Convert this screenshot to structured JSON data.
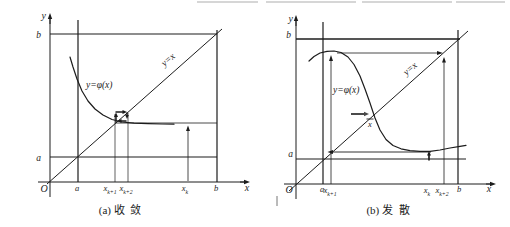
{
  "figure": {
    "background": "#ffffff",
    "ink": "#1c1c1c",
    "artifacts": {
      "top_crop_marks": [
        {
          "name": "cropped-text-remnant",
          "x1": 197,
          "x2": 258,
          "y": 2
        },
        {
          "name": "cropped-text-remnant",
          "x1": 266,
          "x2": 356,
          "y": 2
        },
        {
          "name": "cropped-text-remnant",
          "x1": 362,
          "x2": 452,
          "y": 2
        },
        {
          "name": "cropped-text-remnant",
          "x1": 456,
          "x2": 505,
          "y": 2
        }
      ],
      "stray_mark": {
        "name": "stray-vertical-mark",
        "x1": 277,
        "y1": 196,
        "x2": 277,
        "y2": 206,
        "w": 0.9,
        "color": "#666666"
      }
    },
    "panels": [
      {
        "id": "a",
        "caption": "(a) 收  敛",
        "lines": [
          {
            "name": "y-axis",
            "x1": 50,
            "y1": 197,
            "x2": 50,
            "y2": 16,
            "w": 1
          },
          {
            "name": "x-axis",
            "x1": 38,
            "y1": 182,
            "x2": 246,
            "y2": 182,
            "w": 1
          },
          {
            "name": "line-y-equals-b",
            "x1": 50,
            "y1": 34,
            "x2": 217,
            "y2": 34,
            "w": 1.2
          },
          {
            "name": "line-y-equals-a",
            "x1": 50,
            "y1": 157,
            "x2": 217,
            "y2": 157,
            "w": 1.2
          },
          {
            "name": "line-x-equals-a",
            "x1": 78,
            "y1": 20,
            "x2": 78,
            "y2": 182,
            "w": 1.2
          },
          {
            "name": "line-x-equals-b",
            "x1": 217,
            "y1": 30,
            "x2": 217,
            "y2": 182,
            "w": 1.2
          },
          {
            "name": "diagonal-y-equals-x",
            "x1": 47,
            "y1": 184,
            "x2": 222,
            "y2": 29,
            "w": 1
          },
          {
            "name": "iteration-level-line",
            "x1": 115,
            "y1": 123,
            "x2": 217,
            "y2": 123,
            "w": 0.8
          },
          {
            "name": "guide-line-x-k1",
            "x1": 115,
            "y1": 182,
            "x2": 115,
            "y2": 114,
            "w": 0.7
          },
          {
            "name": "guide-line-x-k2",
            "x1": 128,
            "y1": 182,
            "x2": 128,
            "y2": 113,
            "w": 0.7
          }
        ],
        "arrows": [
          {
            "name": "y-axis-arrowhead",
            "x1": 50,
            "y1": 24,
            "x2": 50,
            "y2": 13,
            "w": 1,
            "head": 6,
            "hw": 2.2
          },
          {
            "name": "x-axis-arrowhead",
            "x1": 240,
            "y1": 182,
            "x2": 250,
            "y2": 182,
            "w": 1,
            "head": 6,
            "hw": 2.2
          },
          {
            "name": "arrow-up-at-xk",
            "x1": 188,
            "y1": 181,
            "x2": 188,
            "y2": 125.5,
            "w": 0.8,
            "head": 5.5,
            "hw": 2
          },
          {
            "name": "cobweb-arrow-up",
            "x1": 116,
            "y1": 122.5,
            "x2": 116,
            "y2": 112.5,
            "w": 1.5,
            "head": 4.5,
            "hw": 2
          },
          {
            "name": "cobweb-arrow-right",
            "x1": 115.5,
            "y1": 112,
            "x2": 127,
            "y2": 112,
            "w": 1.5,
            "head": 4.5,
            "hw": 2
          },
          {
            "name": "cobweb-arrow-down",
            "x1": 127,
            "y1": 112.5,
            "x2": 127,
            "y2": 119,
            "w": 1.5,
            "head": 4,
            "hw": 1.8
          },
          {
            "name": "cobweb-arrow-left",
            "x1": 126.5,
            "y1": 121,
            "x2": 117,
            "y2": 121,
            "w": 1.5,
            "head": 4.5,
            "hw": 2
          }
        ],
        "curve": {
          "name": "curve-phi-of-x",
          "w": 1.2,
          "points": [
            [
              70,
              57
            ],
            [
              73,
              67
            ],
            [
              77,
              79
            ],
            [
              82,
              91
            ],
            [
              88,
              101
            ],
            [
              95,
              109
            ],
            [
              103,
              115
            ],
            [
              112,
              119.5
            ],
            [
              122,
              122
            ],
            [
              134,
              123.2
            ],
            [
              148,
              123.7
            ],
            [
              162,
              124
            ],
            [
              174,
              124.2
            ]
          ]
        },
        "texts": [
          {
            "name": "y-axis-label",
            "t": "y",
            "x": 46,
            "y": 19,
            "anchor": "end",
            "size": 10,
            "it": true
          },
          {
            "name": "x-axis-label",
            "t": "x",
            "x": 247,
            "y": 191,
            "anchor": "middle",
            "size": 10,
            "it": true
          },
          {
            "name": "origin-label",
            "t": "O",
            "x": 44,
            "y": 192,
            "anchor": "middle",
            "size": 10,
            "it": true
          },
          {
            "name": "b-value-label",
            "t": "b",
            "x": 41,
            "y": 38,
            "anchor": "end",
            "size": 9.5,
            "it": true
          },
          {
            "name": "a-value-label",
            "t": "a",
            "x": 41,
            "y": 161,
            "anchor": "end",
            "size": 9.5,
            "it": true
          },
          {
            "name": "curve-equation-label",
            "t": "y=φ(x)",
            "x": 86,
            "y": 88,
            "anchor": "start",
            "size": 9.5,
            "it": true
          },
          {
            "name": "diagonal-equation-label",
            "t": "y=x",
            "x": 170,
            "y": 62,
            "anchor": "middle",
            "size": 9.5,
            "it": true,
            "rotate": -41
          },
          {
            "name": "tick-a",
            "t": "a",
            "x": 77,
            "y": 191,
            "anchor": "middle",
            "size": 8.5,
            "it": true
          },
          {
            "name": "tick-x-k1",
            "t": "x",
            "sub": "k+1",
            "x": 110,
            "y": 191,
            "anchor": "middle",
            "size": 8.5,
            "it": true
          },
          {
            "name": "tick-x-k2",
            "t": "x",
            "sub": "k+2",
            "x": 126,
            "y": 191,
            "anchor": "middle",
            "size": 8.5,
            "it": true
          },
          {
            "name": "tick-x-k",
            "t": "x",
            "sub": "k",
            "x": 185,
            "y": 191,
            "anchor": "middle",
            "size": 8.5,
            "it": true
          },
          {
            "name": "tick-b",
            "t": "b",
            "x": 216,
            "y": 191,
            "anchor": "middle",
            "size": 8.5,
            "it": true
          }
        ]
      },
      {
        "id": "b",
        "caption": "(b) 发  散",
        "lines": [
          {
            "name": "y-axis",
            "x1": 296,
            "y1": 199,
            "x2": 296,
            "y2": 18,
            "w": 1
          },
          {
            "name": "x-axis",
            "x1": 284,
            "y1": 184,
            "x2": 492,
            "y2": 184,
            "w": 1
          },
          {
            "name": "line-y-equals-b",
            "x1": 296,
            "y1": 39,
            "x2": 460,
            "y2": 39,
            "w": 1.3
          },
          {
            "name": "line-y-equals-a",
            "x1": 296,
            "y1": 159,
            "x2": 466,
            "y2": 159,
            "w": 1.2
          },
          {
            "name": "line-x-equals-a",
            "x1": 323,
            "y1": 22,
            "x2": 323,
            "y2": 184,
            "w": 1.2
          },
          {
            "name": "line-x-equals-b",
            "x1": 458,
            "y1": 30,
            "x2": 458,
            "y2": 184,
            "w": 1.2
          },
          {
            "name": "diagonal-y-equals-x",
            "x1": 289,
            "y1": 191,
            "x2": 468,
            "y2": 31,
            "w": 1
          },
          {
            "name": "fixed-point-overbar",
            "x1": 366.5,
            "y1": 119,
            "x2": 373.5,
            "y2": 119,
            "w": 0.9
          }
        ],
        "arrows": [
          {
            "name": "y-axis-arrowhead",
            "x1": 296,
            "y1": 26,
            "x2": 296,
            "y2": 15,
            "w": 1,
            "head": 6,
            "hw": 2.2
          },
          {
            "name": "x-axis-arrowhead",
            "x1": 486,
            "y1": 184,
            "x2": 496,
            "y2": 184,
            "w": 1,
            "head": 6,
            "hw": 2.2
          },
          {
            "name": "arrow-up-at-xk1",
            "x1": 331,
            "y1": 184,
            "x2": 331,
            "y2": 55,
            "w": 0.8,
            "head": 6,
            "hw": 2
          },
          {
            "name": "arrow-right-top-level",
            "x1": 337,
            "y1": 53,
            "x2": 443,
            "y2": 53,
            "w": 0.8,
            "head": 6,
            "hw": 2
          },
          {
            "name": "arrow-up-at-xk2",
            "x1": 444,
            "y1": 184,
            "x2": 444,
            "y2": 57,
            "w": 0.8,
            "head": 5.5,
            "hw": 2
          },
          {
            "name": "arrow-left-low-level",
            "x1": 431,
            "y1": 152,
            "x2": 327.5,
            "y2": 152,
            "w": 0.9,
            "head": 5.5,
            "hw": 2
          },
          {
            "name": "arrow-up-at-xk-short",
            "x1": 429,
            "y1": 160.5,
            "x2": 429,
            "y2": 151,
            "w": 1.7,
            "head": 4.5,
            "hw": 2
          },
          {
            "name": "arrow-right-at-fixed-point",
            "x1": 351,
            "y1": 114,
            "x2": 369,
            "y2": 114,
            "w": 2,
            "head": 5,
            "hw": 2.2,
            "color": "#4a4a4a"
          }
        ],
        "curve": {
          "name": "curve-phi-of-x",
          "w": 1.2,
          "points": [
            [
              309,
              61
            ],
            [
              314,
              56.5
            ],
            [
              320,
              53
            ],
            [
              327,
              51.3
            ],
            [
              334,
              51
            ],
            [
              341,
              52.5
            ],
            [
              348,
              57
            ],
            [
              354,
              64.5
            ],
            [
              360,
              76
            ],
            [
              365,
              89
            ],
            [
              370,
              103
            ],
            [
              375,
              118
            ],
            [
              380,
              130
            ],
            [
              386,
              139.5
            ],
            [
              393,
              145.5
            ],
            [
              401,
              148.8
            ],
            [
              410,
              150.6
            ],
            [
              420,
              151.4
            ],
            [
              430,
              151.3
            ],
            [
              440,
              150
            ],
            [
              450,
              148
            ],
            [
              460,
              146.3
            ],
            [
              466,
              145.3
            ]
          ]
        },
        "texts": [
          {
            "name": "y-axis-label",
            "t": "y",
            "x": 293,
            "y": 22,
            "anchor": "end",
            "size": 10,
            "it": true
          },
          {
            "name": "x-axis-label",
            "t": "x",
            "x": 489,
            "y": 192,
            "anchor": "middle",
            "size": 10,
            "it": true
          },
          {
            "name": "origin-label",
            "t": "O",
            "x": 289,
            "y": 193,
            "anchor": "middle",
            "size": 10,
            "it": true
          },
          {
            "name": "b-value-label",
            "t": "b",
            "x": 291,
            "y": 38,
            "anchor": "end",
            "size": 9.5,
            "it": true
          },
          {
            "name": "a-value-label",
            "t": "a",
            "x": 293,
            "y": 157,
            "anchor": "end",
            "size": 9.5,
            "it": true
          },
          {
            "name": "curve-equation-label",
            "t": "y=φ(x)",
            "x": 333,
            "y": 93,
            "anchor": "start",
            "size": 9.5,
            "it": true
          },
          {
            "name": "diagonal-equation-label",
            "t": "y=x",
            "x": 412,
            "y": 71,
            "anchor": "middle",
            "size": 9.5,
            "it": true,
            "rotate": -41
          },
          {
            "name": "fixed-point-label",
            "t": "x",
            "x": 370,
            "y": 127,
            "anchor": "middle",
            "size": 8.5,
            "it": true
          },
          {
            "name": "tick-a",
            "t": "a",
            "x": 322,
            "y": 192,
            "anchor": "middle",
            "size": 8.5,
            "it": true
          },
          {
            "name": "tick-x-k1",
            "t": "x",
            "sub": "k+1",
            "x": 330,
            "y": 193,
            "anchor": "middle",
            "size": 8.5,
            "it": true
          },
          {
            "name": "tick-x-k",
            "t": "x",
            "sub": "k",
            "x": 427,
            "y": 193,
            "anchor": "middle",
            "size": 8.5,
            "it": true
          },
          {
            "name": "tick-x-k2",
            "t": "x",
            "sub": "k+2",
            "x": 442,
            "y": 193,
            "anchor": "middle",
            "size": 8.5,
            "it": true
          },
          {
            "name": "tick-b",
            "t": "b",
            "x": 459,
            "y": 192,
            "anchor": "middle",
            "size": 8.5,
            "it": true
          }
        ]
      }
    ]
  }
}
